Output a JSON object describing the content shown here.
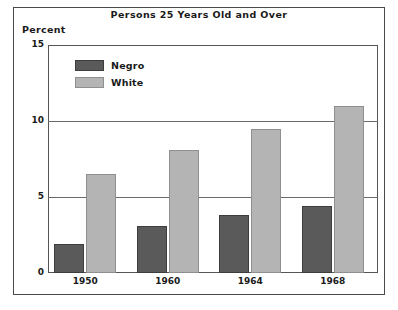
{
  "chart_data": {
    "type": "bar",
    "title": "Persons 25 Years Old and Over",
    "xlabel": "",
    "ylabel": "Percent",
    "ylim": [
      0,
      15
    ],
    "yticks": [
      0,
      5,
      10,
      15
    ],
    "ytick_labels": [
      "0",
      "5",
      "10",
      "15"
    ],
    "grid": true,
    "legend_position": "upper-left-inside",
    "categories": [
      "1950",
      "1960",
      "1964",
      "1968"
    ],
    "series": [
      {
        "name": "Negro",
        "color": "#5a5a5a",
        "values": [
          1.9,
          3.1,
          3.8,
          4.4
        ]
      },
      {
        "name": "White",
        "color": "#b4b4b4",
        "values": [
          6.5,
          8.1,
          9.5,
          11.0
        ]
      }
    ]
  },
  "figure": {
    "title": "Persons 25 Years Old and Over",
    "axis_unit_label": "Percent"
  }
}
